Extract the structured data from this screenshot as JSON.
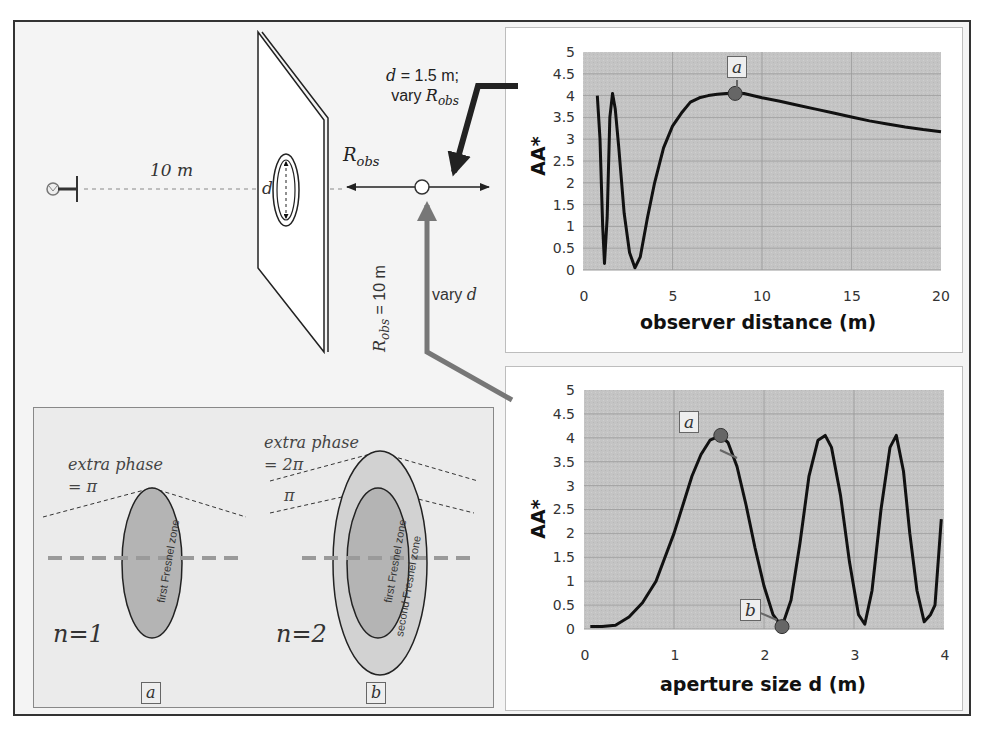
{
  "diagram": {
    "source_distance_label": "10 m",
    "aperture_label": "d",
    "robs_label": "R",
    "robs_sub": "obs",
    "top_annotation": {
      "line1_var": "d",
      "line1_rest": " = 1.5 m;",
      "line2_prefix": "vary ",
      "line2_var": "R",
      "line2_sub": "obs"
    },
    "bottom_annotation": {
      "var": "R",
      "sub": "obs",
      "rest": " = 10 m",
      "vary_prefix": "vary ",
      "vary_var": "d"
    },
    "arrow_colors": {
      "top": "#222222",
      "bottom": "#777777"
    }
  },
  "inset": {
    "panel_a": {
      "phase_line1": "extra phase",
      "phase_line2": "= π",
      "n_label": "n=1",
      "zone_label": "first Fresnel zone",
      "tag": "a"
    },
    "panel_b": {
      "phase_line1": "extra phase",
      "phase_line2": "= 2π",
      "pi_label": "π",
      "n_label": "n=2",
      "zone1_label": "first Fresnel zone",
      "zone2_label": "second Fresnel zone",
      "tag": "b"
    }
  },
  "chart_data": [
    {
      "type": "line",
      "title": "",
      "xlabel": "observer distance (m)",
      "ylabel": "AA*",
      "xlim": [
        0,
        20
      ],
      "ylim": [
        0,
        5
      ],
      "xticks": [
        "0",
        "5",
        "10",
        "15",
        "20"
      ],
      "yticks": [
        "0",
        "0.5",
        "1",
        "1.5",
        "2",
        "2.5",
        "3",
        "3.5",
        "4",
        "4.5",
        "5"
      ],
      "grid": true,
      "plot_bg": "#c4c4c4",
      "series": [
        {
          "name": "AA*",
          "x": [
            0.8,
            0.95,
            1.1,
            1.2,
            1.35,
            1.5,
            1.65,
            1.8,
            2.0,
            2.3,
            2.6,
            2.9,
            3.2,
            3.6,
            4.0,
            4.5,
            5.0,
            5.5,
            6.0,
            6.5,
            7.0,
            7.5,
            8.0,
            8.5,
            9.0,
            10,
            11,
            12,
            13,
            14,
            15,
            16,
            17,
            18,
            19,
            20
          ],
          "values": [
            4.0,
            3.0,
            1.0,
            0.15,
            1.2,
            3.5,
            4.05,
            3.7,
            2.8,
            1.3,
            0.4,
            0.05,
            0.3,
            1.2,
            2.0,
            2.8,
            3.3,
            3.6,
            3.85,
            3.95,
            4.0,
            4.03,
            4.05,
            4.06,
            4.05,
            3.95,
            3.87,
            3.78,
            3.69,
            3.6,
            3.51,
            3.42,
            3.35,
            3.28,
            3.22,
            3.17
          ]
        }
      ],
      "annotations": [
        {
          "label": "a",
          "x": 8.5,
          "y": 4.05
        }
      ]
    },
    {
      "type": "line",
      "title": "",
      "xlabel": "aperture size d (m)",
      "ylabel": "AA*",
      "xlim": [
        0,
        4
      ],
      "ylim": [
        0,
        5
      ],
      "xticks": [
        "0",
        "1",
        "2",
        "3",
        "4"
      ],
      "yticks": [
        "0",
        "0.5",
        "1",
        "1.5",
        "2",
        "2.5",
        "3",
        "3.5",
        "4",
        "4.5",
        "5"
      ],
      "grid": true,
      "plot_bg": "#c4c4c4",
      "series": [
        {
          "name": "AA*",
          "x": [
            0.07,
            0.2,
            0.35,
            0.5,
            0.65,
            0.8,
            0.9,
            1.0,
            1.1,
            1.2,
            1.3,
            1.4,
            1.52,
            1.6,
            1.7,
            1.8,
            1.9,
            2.0,
            2.1,
            2.2,
            2.3,
            2.4,
            2.5,
            2.6,
            2.68,
            2.75,
            2.85,
            2.95,
            3.05,
            3.12,
            3.2,
            3.3,
            3.4,
            3.47,
            3.55,
            3.62,
            3.7,
            3.78,
            3.85,
            3.9,
            3.97
          ],
          "values": [
            0.05,
            0.05,
            0.08,
            0.25,
            0.55,
            1.0,
            1.5,
            2.0,
            2.6,
            3.2,
            3.65,
            3.95,
            4.05,
            3.9,
            3.4,
            2.6,
            1.7,
            0.9,
            0.3,
            0.05,
            0.6,
            1.8,
            3.2,
            3.95,
            4.05,
            3.8,
            2.8,
            1.4,
            0.3,
            0.1,
            0.8,
            2.5,
            3.8,
            4.05,
            3.3,
            2.0,
            0.8,
            0.15,
            0.3,
            0.5,
            2.3
          ]
        }
      ],
      "annotations": [
        {
          "label": "a",
          "x": 1.52,
          "y": 4.05
        },
        {
          "label": "b",
          "x": 2.2,
          "y": 0.05
        }
      ]
    }
  ]
}
